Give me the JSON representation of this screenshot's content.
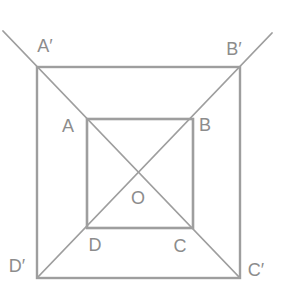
{
  "figure": {
    "canvas": {
      "width": 287,
      "height": 284
    },
    "colors": {
      "background": "#ffffff",
      "line": "#9e9e9e",
      "label": "#8c8c8c"
    },
    "label_font_size": 18,
    "squares": [
      {
        "name": "outer-square",
        "vertices": "A' B' C' D'",
        "x1": 37,
        "y1": 67,
        "x2": 240,
        "y2": 278,
        "stroke_width": 2.4
      },
      {
        "name": "inner-square",
        "vertices": "A B C D",
        "x1": 87,
        "y1": 119,
        "x2": 193,
        "y2": 228,
        "stroke_width": 2.6
      }
    ],
    "diagonals": [
      {
        "name": "diagonal-aprime-cprime",
        "through": "A' A O C C'",
        "x1": 3,
        "y1": 31,
        "x2": 240,
        "y2": 278,
        "stroke_width": 1.8
      },
      {
        "name": "diagonal-bprime-dprime",
        "through": "B' B O D D'",
        "x1": 272,
        "y1": 33,
        "x2": 37,
        "y2": 278,
        "stroke_width": 1.8
      }
    ],
    "labels": [
      {
        "name": "vertex-label-a-prime",
        "text": "A′",
        "x": 45,
        "y": 47
      },
      {
        "name": "vertex-label-b-prime",
        "text": "B′",
        "x": 234,
        "y": 50
      },
      {
        "name": "vertex-label-c-prime",
        "text": "C′",
        "x": 256,
        "y": 271
      },
      {
        "name": "vertex-label-d-prime",
        "text": "D′",
        "x": 17,
        "y": 267
      },
      {
        "name": "vertex-label-a",
        "text": "A",
        "x": 68,
        "y": 127
      },
      {
        "name": "vertex-label-b",
        "text": "B",
        "x": 205,
        "y": 126
      },
      {
        "name": "vertex-label-c",
        "text": "C",
        "x": 180,
        "y": 247
      },
      {
        "name": "vertex-label-d",
        "text": "D",
        "x": 95,
        "y": 246
      },
      {
        "name": "center-label-o",
        "text": "O",
        "x": 138,
        "y": 199
      }
    ]
  }
}
